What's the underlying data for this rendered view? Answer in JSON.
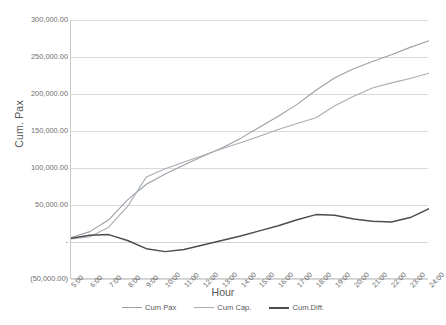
{
  "chart_data": {
    "type": "line",
    "title": "",
    "xlabel": "Hour",
    "ylabel": "Cum. Pax",
    "ylim": [
      -50000,
      300000
    ],
    "ytick_labels": [
      "300,000.00",
      "250,000.00",
      "200,000.00",
      "150,000.00",
      "100,000.00",
      "50,000.00",
      "-",
      "(50,000.00)"
    ],
    "ytick_values": [
      300000,
      250000,
      200000,
      150000,
      100000,
      50000,
      0,
      -50000
    ],
    "grid": true,
    "legend_position": "bottom",
    "categories": [
      "5:00",
      "6:00",
      "7:00",
      "8:00",
      "9:00",
      "10:00",
      "11:00",
      "12:00",
      "13:00",
      "14:00",
      "15:00",
      "16:00",
      "17:00",
      "18:00",
      "19:00",
      "20:00",
      "21:00",
      "22:00",
      "23:00",
      "24:00"
    ],
    "series": [
      {
        "name": "Cum Pax",
        "color": "#9aa0a6",
        "width": 1.1,
        "values": [
          6000,
          14000,
          30000,
          57000,
          78000,
          92000,
          104000,
          116000,
          127000,
          140000,
          155000,
          170000,
          186000,
          205000,
          222000,
          234000,
          244000,
          253000,
          263000,
          272000
        ]
      },
      {
        "name": "Cum Cap.",
        "color": "#a8adb2",
        "width": 1.1,
        "values": [
          4000,
          7000,
          20000,
          48000,
          88000,
          99000,
          108000,
          117000,
          126000,
          134000,
          143000,
          152000,
          160000,
          168000,
          184000,
          197000,
          208000,
          215000,
          221000,
          228000
        ]
      },
      {
        "name": "Cum.Diff.",
        "color": "#4d4d4d",
        "width": 1.5,
        "values": [
          5000,
          9000,
          10000,
          2000,
          -9000,
          -13000,
          -10000,
          -4000,
          2000,
          8000,
          15000,
          22000,
          30000,
          37000,
          36000,
          31000,
          28000,
          27000,
          33000,
          45000
        ]
      }
    ]
  },
  "axis": {
    "y_title": "Cum. Pax",
    "x_title": "Hour"
  }
}
